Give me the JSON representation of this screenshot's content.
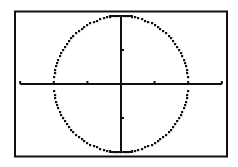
{
  "chart_data": {
    "type": "line",
    "title": "",
    "xlabel": "",
    "ylabel": "",
    "equation": "x^2 + y^2 = 4",
    "xlim": [
      -3,
      3
    ],
    "ylim": [
      -2,
      2
    ],
    "x_ticks": [
      -3,
      -2,
      -1,
      0,
      1,
      2,
      3
    ],
    "y_ticks": [
      -2,
      -1,
      0,
      1,
      2
    ],
    "grid": false,
    "legend": null,
    "series": [
      {
        "name": "circle",
        "center": [
          0,
          0
        ],
        "radius": 2,
        "style": "pixelated-dotted"
      }
    ]
  },
  "colors": {
    "background": "#ffffff",
    "ink": "#111111"
  }
}
